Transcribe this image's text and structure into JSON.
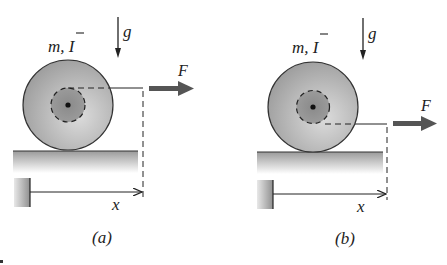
{
  "figure": {
    "panels": [
      {
        "id": "a",
        "caption": "(a)",
        "mass_label": "m, ",
        "inertia_label": "I",
        "gravity_label": "g",
        "force_label": "F",
        "displacement_label": "x",
        "force_application": "top of inner hub"
      },
      {
        "id": "b",
        "caption": "(b)",
        "mass_label": "m, ",
        "inertia_label": "I",
        "gravity_label": "g",
        "force_label": "F",
        "displacement_label": "x",
        "force_application": "bottom of inner hub"
      }
    ],
    "colors": {
      "ink": "#222222",
      "disk_light": "#d6d6d6",
      "disk_dark": "#9a9a9a",
      "hub": "#8c8c8c",
      "ground_top": "#9e9e9e",
      "force_arrow": "#555555"
    }
  }
}
